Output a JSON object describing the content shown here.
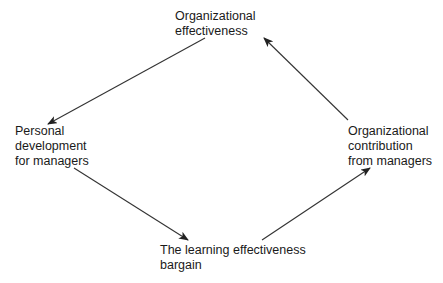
{
  "diagram": {
    "type": "cycle",
    "nodes": {
      "top": {
        "lines": [
          "Organizational",
          "effectiveness"
        ]
      },
      "left": {
        "lines": [
          "Personal",
          "development",
          "for managers"
        ]
      },
      "right": {
        "lines": [
          "Organizational",
          "contribution",
          "from managers"
        ]
      },
      "bottom": {
        "lines": [
          "The learning effectiveness",
          "bargain"
        ]
      }
    },
    "edges": [
      {
        "from": "top",
        "to": "left"
      },
      {
        "from": "left",
        "to": "bottom"
      },
      {
        "from": "bottom",
        "to": "right"
      },
      {
        "from": "right",
        "to": "top"
      }
    ],
    "colors": {
      "line": "#222222",
      "text": "#1a1a1a",
      "background": "#ffffff"
    }
  }
}
